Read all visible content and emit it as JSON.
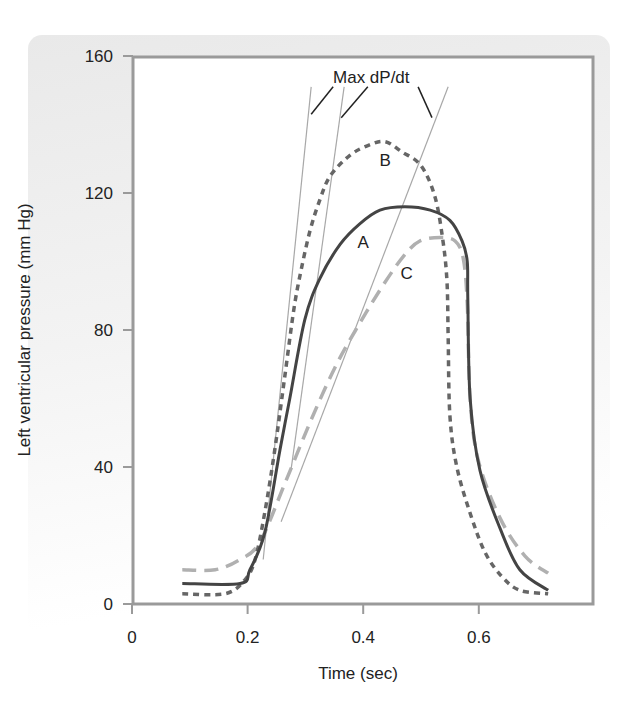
{
  "chart_data": {
    "type": "line",
    "title": "",
    "xlabel": "Time (sec)",
    "ylabel": "Left ventricular pressure (mm Hg)",
    "xlim": [
      0,
      0.8
    ],
    "ylim": [
      0,
      160
    ],
    "x_ticks": [
      0,
      0.2,
      0.4,
      0.6
    ],
    "x_tick_labels": [
      "0",
      "0.2",
      "0.4",
      "0.6"
    ],
    "y_ticks": [
      0,
      40,
      80,
      120,
      160
    ],
    "y_tick_labels": [
      "0",
      "40",
      "80",
      "120",
      "160"
    ],
    "grid": false,
    "legend": "none (curves labeled inline A, B, C)",
    "series": [
      {
        "name": "A",
        "style": "solid",
        "color": "#444444",
        "label_pos": [
          0.4,
          104
        ],
        "points": [
          [
            0.087,
            6
          ],
          [
            0.187,
            6
          ],
          [
            0.204,
            10
          ],
          [
            0.23,
            21
          ],
          [
            0.256,
            45
          ],
          [
            0.273,
            60
          ],
          [
            0.299,
            83
          ],
          [
            0.325,
            95
          ],
          [
            0.36,
            105
          ],
          [
            0.394,
            111
          ],
          [
            0.429,
            115
          ],
          [
            0.472,
            116
          ],
          [
            0.516,
            115
          ],
          [
            0.55,
            112
          ],
          [
            0.571,
            106
          ],
          [
            0.58,
            100
          ],
          [
            0.581,
            89
          ],
          [
            0.585,
            60
          ],
          [
            0.602,
            39
          ],
          [
            0.637,
            22
          ],
          [
            0.671,
            10
          ],
          [
            0.72,
            4
          ]
        ]
      },
      {
        "name": "B",
        "style": "dotted",
        "color": "#666666",
        "label_pos": [
          0.438,
          128
        ],
        "points": [
          [
            0.087,
            3
          ],
          [
            0.161,
            3
          ],
          [
            0.195,
            7
          ],
          [
            0.213,
            13
          ],
          [
            0.23,
            27
          ],
          [
            0.247,
            45
          ],
          [
            0.264,
            66
          ],
          [
            0.28,
            86
          ],
          [
            0.292,
            97
          ],
          [
            0.308,
            109
          ],
          [
            0.325,
            118
          ],
          [
            0.343,
            125
          ],
          [
            0.377,
            131
          ],
          [
            0.41,
            134
          ],
          [
            0.438,
            135
          ],
          [
            0.467,
            132
          ],
          [
            0.5,
            128
          ],
          [
            0.524,
            119
          ],
          [
            0.538,
            106
          ],
          [
            0.545,
            94
          ],
          [
            0.547,
            78
          ],
          [
            0.55,
            55
          ],
          [
            0.562,
            40
          ],
          [
            0.586,
            26
          ],
          [
            0.611,
            15
          ],
          [
            0.64,
            8
          ],
          [
            0.671,
            4
          ],
          [
            0.72,
            3
          ]
        ]
      },
      {
        "name": "C",
        "style": "dashed",
        "color": "#b0b0b0",
        "label_pos": [
          0.475,
          95
        ],
        "points": [
          [
            0.087,
            10
          ],
          [
            0.144,
            10
          ],
          [
            0.187,
            13
          ],
          [
            0.221,
            18
          ],
          [
            0.264,
            35
          ],
          [
            0.308,
            53
          ],
          [
            0.351,
            69
          ],
          [
            0.394,
            82
          ],
          [
            0.438,
            94
          ],
          [
            0.472,
            102
          ],
          [
            0.498,
            106
          ],
          [
            0.533,
            107
          ],
          [
            0.559,
            106
          ],
          [
            0.573,
            101
          ],
          [
            0.58,
            88
          ],
          [
            0.585,
            60
          ],
          [
            0.599,
            42
          ],
          [
            0.637,
            25
          ],
          [
            0.68,
            14
          ],
          [
            0.72,
            9
          ]
        ]
      }
    ],
    "annotations": [
      {
        "text": "Max dP/dt",
        "pos": [
          0.414,
          152
        ]
      }
    ],
    "tangent_lines": [
      {
        "from": [
          0.227,
          13
        ],
        "to": [
          0.31,
          151
        ]
      },
      {
        "from": [
          0.275,
          39
        ],
        "to": [
          0.367,
          151
        ]
      },
      {
        "from": [
          0.258,
          24
        ],
        "to": [
          0.547,
          151
        ]
      }
    ],
    "leader_lines": [
      {
        "from": [
          0.31,
          143
        ],
        "to": [
          0.348,
          151
        ]
      },
      {
        "from": [
          0.362,
          142
        ],
        "to": [
          0.408,
          151
        ]
      },
      {
        "from": [
          0.495,
          151
        ],
        "to": [
          0.519,
          142
        ]
      }
    ]
  }
}
